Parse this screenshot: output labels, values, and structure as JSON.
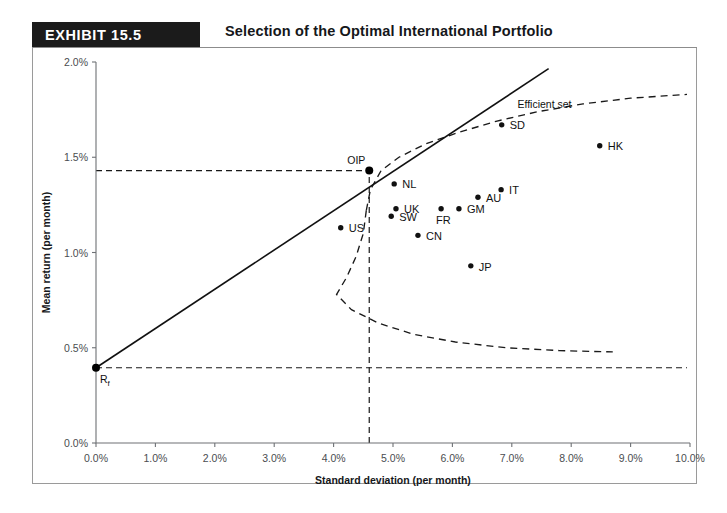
{
  "header": {
    "badge": "EXHIBIT 15.5",
    "title": "Selection of the Optimal International Portfolio"
  },
  "chart_data": {
    "type": "scatter",
    "title": "Selection of the Optimal International Portfolio",
    "xlabel": "Standard deviation (per month)",
    "ylabel": "Mean return (per month)",
    "xlim": [
      0.0,
      10.0
    ],
    "ylim": [
      0.0,
      2.0
    ],
    "xticks": [
      "0.0%",
      "1.0%",
      "2.0%",
      "3.0%",
      "4.0%",
      "5.0%",
      "6.0%",
      "7.0%",
      "8.0%",
      "9.0%",
      "10.0%"
    ],
    "xtick_values": [
      0,
      1,
      2,
      3,
      4,
      5,
      6,
      7,
      8,
      9,
      10
    ],
    "yticks": [
      "0.0%",
      "0.5%",
      "1.0%",
      "1.5%",
      "2.0%"
    ],
    "ytick_values": [
      0,
      0.5,
      1.0,
      1.5,
      2.0
    ],
    "grid": false,
    "legend": false,
    "points": [
      {
        "name": "US",
        "x": 4.12,
        "y": 1.13,
        "label_dx": 8,
        "label_dy": 4
      },
      {
        "name": "NL",
        "x": 5.02,
        "y": 1.36,
        "label_dx": 8,
        "label_dy": 4
      },
      {
        "name": "UK",
        "x": 5.05,
        "y": 1.23,
        "label_dx": 8,
        "label_dy": 4
      },
      {
        "name": "SW",
        "x": 4.97,
        "y": 1.19,
        "label_dx": 8,
        "label_dy": 5
      },
      {
        "name": "CN",
        "x": 5.42,
        "y": 1.09,
        "label_dx": 8,
        "label_dy": 5
      },
      {
        "name": "FR",
        "x": 5.81,
        "y": 1.23,
        "label_dx": -5,
        "label_dy": 15
      },
      {
        "name": "GM",
        "x": 6.11,
        "y": 1.23,
        "label_dx": 8,
        "label_dy": 4
      },
      {
        "name": "AU",
        "x": 6.43,
        "y": 1.29,
        "label_dx": 8,
        "label_dy": 5
      },
      {
        "name": "IT",
        "x": 6.82,
        "y": 1.33,
        "label_dx": 8,
        "label_dy": 4
      },
      {
        "name": "JP",
        "x": 6.31,
        "y": 0.93,
        "label_dx": 8,
        "label_dy": 5
      },
      {
        "name": "SD",
        "x": 6.83,
        "y": 1.67,
        "label_dx": 8,
        "label_dy": 4
      },
      {
        "name": "HK",
        "x": 8.48,
        "y": 1.56,
        "label_dx": 8,
        "label_dy": 4
      }
    ],
    "special_points": [
      {
        "name": "OIP",
        "x": 4.6,
        "y": 1.43,
        "label": "OIP",
        "label_dx": -22,
        "label_dy": -7
      },
      {
        "name": "Rf",
        "x": 0.0,
        "y": 0.395,
        "label": "R",
        "sub": "f",
        "label_dx": 4,
        "label_dy": 15
      }
    ],
    "annotations": [
      {
        "text": "Efficient set",
        "x": 7.55,
        "y": 1.76
      }
    ],
    "series_lines": [
      {
        "name": "capital-market-line",
        "style": "solid",
        "points": [
          [
            0.0,
            0.395
          ],
          [
            7.62,
            1.965
          ]
        ]
      },
      {
        "name": "efficient-set-upper",
        "style": "dashed",
        "points": [
          [
            4.55,
            1.22
          ],
          [
            4.62,
            1.33
          ],
          [
            4.8,
            1.43
          ],
          [
            5.1,
            1.5
          ],
          [
            5.55,
            1.57
          ],
          [
            6.1,
            1.63
          ],
          [
            6.75,
            1.69
          ],
          [
            7.45,
            1.74
          ],
          [
            8.2,
            1.78
          ],
          [
            9.0,
            1.81
          ],
          [
            9.95,
            1.83
          ]
        ]
      },
      {
        "name": "efficient-set-lower",
        "style": "dashed",
        "points": [
          [
            4.55,
            1.22
          ],
          [
            4.5,
            1.1
          ],
          [
            4.38,
            0.98
          ],
          [
            4.22,
            0.87
          ],
          [
            4.05,
            0.78
          ],
          [
            4.3,
            0.7
          ],
          [
            4.75,
            0.63
          ],
          [
            5.35,
            0.57
          ],
          [
            6.05,
            0.53
          ],
          [
            6.9,
            0.5
          ],
          [
            7.8,
            0.485
          ],
          [
            8.7,
            0.478
          ]
        ]
      }
    ],
    "guide_lines": [
      {
        "name": "oip-horizontal-guide",
        "from": [
          0.0,
          1.43
        ],
        "to": [
          4.6,
          1.43
        ]
      },
      {
        "name": "oip-vertical-guide",
        "from": [
          4.6,
          0.0
        ],
        "to": [
          4.6,
          1.43
        ]
      },
      {
        "name": "rf-horizontal-guide",
        "from": [
          0.0,
          0.395
        ],
        "to": [
          9.95,
          0.395
        ]
      }
    ]
  }
}
